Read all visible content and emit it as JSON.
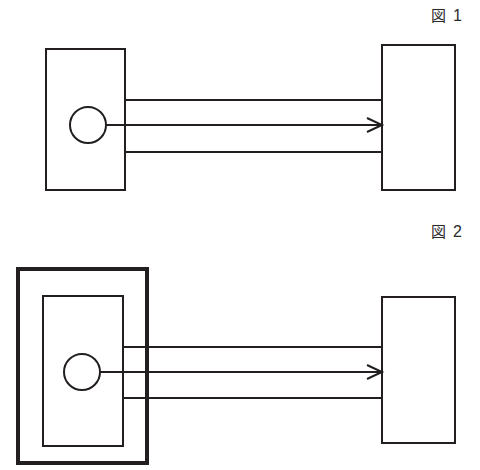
{
  "page": {
    "background_color": "#ffffff",
    "ink_color": "#231f20",
    "width": 480,
    "height": 470
  },
  "figures": [
    {
      "id": "figure-1",
      "label_kanji": "図",
      "label_number": "1",
      "outer_frame": null,
      "source_box": {
        "x": 46,
        "y": 49,
        "w": 79,
        "h": 141,
        "stroke": 2
      },
      "target_box": {
        "x": 382,
        "y": 45,
        "w": 73,
        "h": 145,
        "stroke": 2
      },
      "node_circle": {
        "cx": 88,
        "cy": 125,
        "r": 18
      },
      "connector_lines": [
        {
          "name": "upper-line",
          "y": 100,
          "x1": 125,
          "x2": 382,
          "has_arrow": false
        },
        {
          "name": "middle-line",
          "y": 125,
          "x1": 106,
          "x2": 382,
          "has_arrow": true
        },
        {
          "name": "lower-line",
          "y": 152,
          "x1": 125,
          "x2": 382,
          "has_arrow": false
        }
      ],
      "arrow": {
        "tip_x": 382,
        "tip_y": 125,
        "length": 15,
        "spread": 7
      }
    },
    {
      "id": "figure-2",
      "label_kanji": "図",
      "label_number": "2",
      "outer_frame": {
        "x": 18,
        "y": 269,
        "w": 129,
        "h": 194,
        "stroke": 4
      },
      "source_box": {
        "x": 43,
        "y": 296,
        "w": 80,
        "h": 150,
        "stroke": 2
      },
      "target_box": {
        "x": 382,
        "y": 297,
        "w": 73,
        "h": 146,
        "stroke": 2
      },
      "node_circle": {
        "cx": 82,
        "cy": 372,
        "r": 18
      },
      "connector_lines": [
        {
          "name": "upper-line",
          "y": 347,
          "x1": 123,
          "x2": 382,
          "has_arrow": false
        },
        {
          "name": "middle-line",
          "y": 372,
          "x1": 100,
          "x2": 382,
          "has_arrow": true
        },
        {
          "name": "lower-line",
          "y": 398,
          "x1": 123,
          "x2": 382,
          "has_arrow": false
        }
      ],
      "arrow": {
        "tip_x": 382,
        "tip_y": 372,
        "length": 15,
        "spread": 7
      }
    }
  ]
}
